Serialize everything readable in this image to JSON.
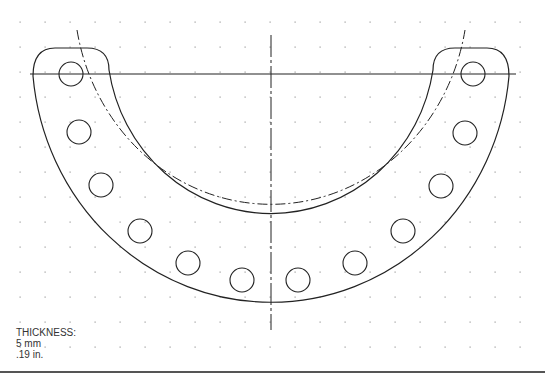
{
  "drawing": {
    "title": "Horseshoe bracket with bolt circle",
    "colors": {
      "line": "#222222",
      "grid": "#9a9a9a",
      "rule": "#555555",
      "text": "#333333"
    },
    "grid": {
      "spacing": 25,
      "origin_x": 20,
      "origin_y": 22
    },
    "center": {
      "x": 271,
      "y": 73
    },
    "outer_radius": 249,
    "inner_radius": 170,
    "bolt_circle_radius": 209,
    "hole_radius": 12,
    "holes": [
      {
        "x": 71,
        "y": 74
      },
      {
        "x": 79,
        "y": 132
      },
      {
        "x": 101,
        "y": 185
      },
      {
        "x": 140,
        "y": 231
      },
      {
        "x": 188,
        "y": 263
      },
      {
        "x": 242,
        "y": 280
      },
      {
        "x": 298,
        "y": 280
      },
      {
        "x": 355,
        "y": 263
      },
      {
        "x": 403,
        "y": 231
      },
      {
        "x": 441,
        "y": 186
      },
      {
        "x": 465,
        "y": 133
      },
      {
        "x": 473,
        "y": 74
      }
    ]
  },
  "notes": {
    "label": "THICKNESS:",
    "metric": "5 mm",
    "imperial": ".19 in."
  }
}
